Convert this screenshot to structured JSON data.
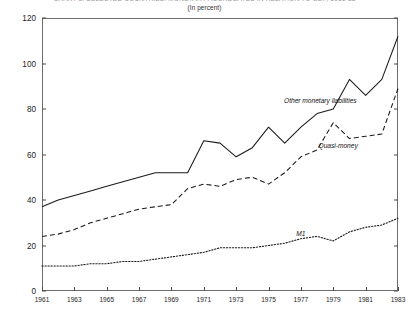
{
  "figure": {
    "clipped_title": "CHART 3. SELECTED COUNTRIES: MONETARY AGGREGATES IN RELATION TO GDP, 1961-83",
    "subtitle": "(In percent)"
  },
  "chart_data": {
    "type": "line",
    "title": "",
    "subtitle": "(In percent)",
    "xlabel": "",
    "ylabel": "",
    "xlim": [
      1961,
      1983
    ],
    "ylim": [
      0,
      120
    ],
    "ytick_values": [
      0,
      20,
      40,
      60,
      80,
      100,
      120
    ],
    "ytick_labels": [
      "0",
      "20",
      "40",
      "60",
      "80",
      "100",
      "120"
    ],
    "xtick_values": [
      1961,
      1963,
      1965,
      1967,
      1969,
      1971,
      1973,
      1975,
      1977,
      1979,
      1981,
      1983
    ],
    "xtick_labels": [
      "1961",
      "1963",
      "1965",
      "1967",
      "1969",
      "1971",
      "1973",
      "1975",
      "1977",
      "1979",
      "1981",
      "1983"
    ],
    "grid": false,
    "legend_position": "inline-annotation",
    "x": [
      1961,
      1962,
      1963,
      1964,
      1965,
      1966,
      1967,
      1968,
      1969,
      1970,
      1971,
      1972,
      1973,
      1974,
      1975,
      1976,
      1977,
      1978,
      1979,
      1980,
      1981,
      1982,
      1983
    ],
    "series": [
      {
        "name": "Other monetary liabilities",
        "style": "solid",
        "color": "#1a1a1a",
        "label_x": 1978.2,
        "label_y": 84.0,
        "values": [
          37,
          40,
          42,
          44,
          46,
          48,
          50,
          52,
          52,
          52,
          66,
          65,
          59,
          63,
          72,
          65,
          72,
          78,
          80,
          93,
          86,
          93,
          112
        ]
      },
      {
        "name": "Quasi-money",
        "style": "dashed",
        "color": "#1a1a1a",
        "label_x": 1979.3,
        "label_y": 64.0,
        "values": [
          24,
          25,
          27,
          30,
          32,
          34,
          36,
          37,
          38,
          45,
          47,
          46,
          49,
          50,
          47,
          52,
          59,
          62,
          74,
          67,
          68,
          69,
          89
        ]
      },
      {
        "name": "M1",
        "style": "dotted",
        "color": "#1a1a1a",
        "label_x": 1977.0,
        "label_y": 25.5,
        "values": [
          11,
          11,
          11,
          12,
          12,
          13,
          13,
          14,
          15,
          16,
          17,
          19,
          19,
          19,
          20,
          21,
          23,
          24,
          22,
          26,
          28,
          29,
          32
        ]
      }
    ]
  }
}
